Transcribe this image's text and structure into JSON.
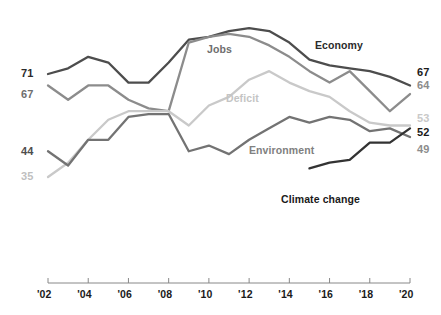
{
  "chart_data": {
    "type": "line",
    "title": "",
    "subtitle": "",
    "xlabel": "",
    "ylabel": "",
    "xlim": [
      2002,
      2020
    ],
    "ylim": [
      30,
      80
    ],
    "grid": false,
    "legend_position": "inline-labels",
    "x": [
      2002,
      2003,
      2004,
      2005,
      2006,
      2007,
      2008,
      2009,
      2010,
      2011,
      2012,
      2013,
      2014,
      2015,
      2016,
      2017,
      2018,
      2019,
      2020
    ],
    "series": [
      {
        "name": "Economy",
        "color": "#4d4d4d",
        "label": "Economy",
        "start_value_label": "71",
        "end_value_label": "67",
        "values": [
          71,
          73,
          77,
          75,
          68,
          68,
          75,
          83,
          84,
          86,
          87,
          86,
          82,
          76,
          74,
          73,
          72,
          70,
          67
        ]
      },
      {
        "name": "Jobs",
        "color": "#8c8c8c",
        "label": "Jobs",
        "start_value_label": "67",
        "end_value_label": "64",
        "values": [
          67,
          62,
          67,
          67,
          62,
          59,
          58,
          82,
          84,
          85,
          84,
          81,
          77,
          72,
          68,
          72,
          65,
          58,
          64
        ]
      },
      {
        "name": "Deficit",
        "color": "#c9c9c9",
        "label": "Deficit",
        "start_value_label": "35",
        "end_value_label": "53",
        "values": [
          35,
          40,
          48,
          55,
          58,
          58,
          58,
          53,
          60,
          63,
          69,
          72,
          68,
          65,
          63,
          58,
          54,
          53,
          53
        ]
      },
      {
        "name": "Environment",
        "color": "#737373",
        "label": "Environment",
        "start_value_label": "44",
        "end_value_label": "52",
        "values": [
          44,
          39,
          48,
          48,
          56,
          57,
          57,
          44,
          46,
          43,
          48,
          52,
          56,
          54,
          56,
          55,
          51,
          52,
          49
        ]
      },
      {
        "name": "Climate change",
        "color": "#333333",
        "label": "Climate change",
        "start_value_label": "",
        "end_value_label": "52",
        "values": [
          null,
          null,
          null,
          null,
          null,
          null,
          null,
          null,
          null,
          null,
          null,
          null,
          null,
          38,
          40,
          41,
          47,
          47,
          52
        ]
      }
    ],
    "left_axis_labels": [
      {
        "text": "71",
        "value": 71,
        "color": "#2b2b2b"
      },
      {
        "text": "67",
        "value": 67,
        "color": "#6e6e6e"
      },
      {
        "text": "44",
        "value": 44,
        "color": "#4d4d4d"
      },
      {
        "text": "35",
        "value": 35,
        "color": "#bfbfbf"
      }
    ],
    "right_axis_labels": [
      {
        "text": "67",
        "value": 67,
        "color": "#1a1a1a"
      },
      {
        "text": "64",
        "value": 64,
        "color": "#8c8c8c"
      },
      {
        "text": "53",
        "value": 53,
        "color": "#c9c9c9"
      },
      {
        "text": "52",
        "value": 52,
        "color": "#1a1a1a"
      },
      {
        "text": "49",
        "value": 49,
        "color": "#8c8c8c"
      }
    ],
    "xtick_labels": [
      "'02",
      "'04",
      "'06",
      "'08",
      "'10",
      "'12",
      "'14",
      "'16",
      "'18",
      "'20"
    ],
    "xtick_values": [
      2002,
      2004,
      2006,
      2008,
      2010,
      2012,
      2014,
      2016,
      2018,
      2020
    ],
    "axis_color": "#888888"
  }
}
